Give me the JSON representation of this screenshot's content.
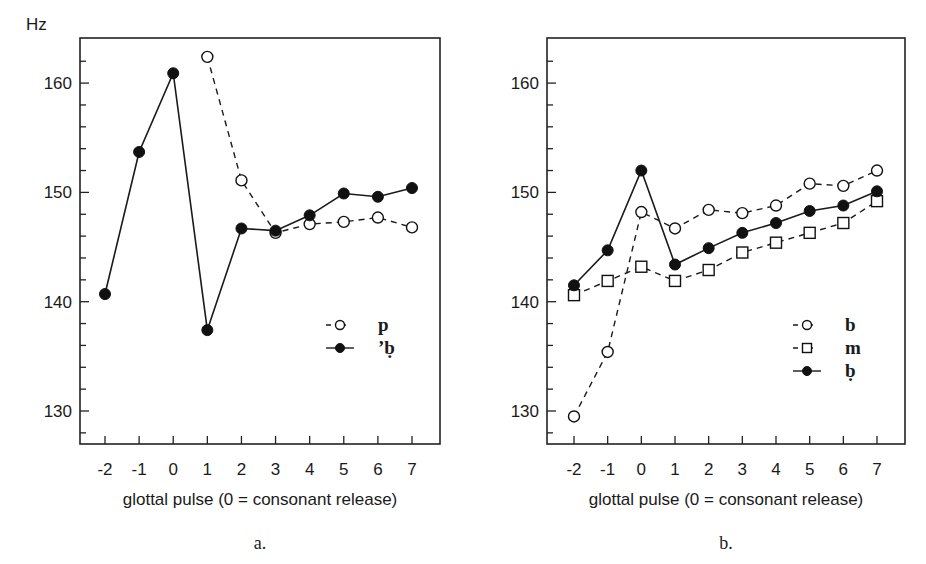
{
  "figure": {
    "y_unit_label": "Hz",
    "panels": [
      {
        "panel_label": "a.",
        "xlabel": "glottal pulse (0 = consonant release)"
      },
      {
        "panel_label": "b.",
        "xlabel": "glottal pulse (0 = consonant release)"
      }
    ]
  },
  "chart_data": [
    {
      "type": "line",
      "title": "",
      "panel_label": "a.",
      "xlabel": "glottal pulse (0 = consonant release)",
      "ylabel": "Hz",
      "x": [
        -2,
        -1,
        0,
        1,
        2,
        3,
        4,
        5,
        6,
        7
      ],
      "ylim": [
        127,
        164
      ],
      "yticks": [
        130,
        140,
        150,
        160
      ],
      "minor_ytick_step": 2,
      "grid": false,
      "legend_position": "right-middle inside plot",
      "series": [
        {
          "name": "p",
          "marker": "open-circle",
          "line": "dashed",
          "values": [
            null,
            null,
            null,
            162.4,
            151.1,
            146.3,
            147.1,
            147.3,
            147.7,
            146.8
          ]
        },
        {
          "name": "’ḅ",
          "marker": "filled-circle",
          "line": "solid",
          "values": [
            140.7,
            153.7,
            160.9,
            137.4,
            146.7,
            146.5,
            147.9,
            149.9,
            149.6,
            150.4
          ]
        }
      ]
    },
    {
      "type": "line",
      "title": "",
      "panel_label": "b.",
      "xlabel": "glottal pulse (0 = consonant release)",
      "ylabel": "Hz",
      "x": [
        -2,
        -1,
        0,
        1,
        2,
        3,
        4,
        5,
        6,
        7
      ],
      "ylim": [
        127,
        164
      ],
      "yticks": [
        130,
        140,
        150,
        160
      ],
      "minor_ytick_step": 2,
      "grid": false,
      "legend_position": "right-middle inside plot",
      "series": [
        {
          "name": "b",
          "marker": "open-circle",
          "line": "dashed",
          "values": [
            129.5,
            135.4,
            148.2,
            146.7,
            148.4,
            148.1,
            148.8,
            150.8,
            150.6,
            152.0
          ]
        },
        {
          "name": "m",
          "marker": "open-square",
          "line": "dashed",
          "values": [
            140.6,
            141.9,
            143.2,
            141.9,
            142.9,
            144.5,
            145.4,
            146.3,
            147.2,
            149.2
          ]
        },
        {
          "name": "ḅ",
          "marker": "filled-circle",
          "line": "solid",
          "values": [
            141.5,
            144.7,
            152.0,
            143.4,
            144.9,
            146.3,
            147.2,
            148.3,
            148.8,
            150.1
          ]
        }
      ]
    }
  ]
}
